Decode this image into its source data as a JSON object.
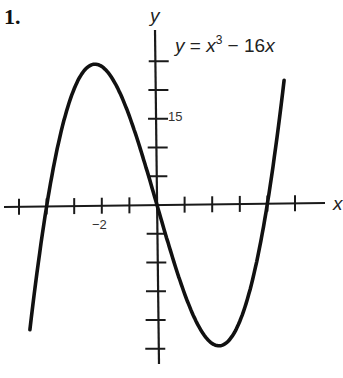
{
  "problem_number": "1.",
  "equation": {
    "lhs": "y",
    "eq": " = ",
    "base": "x",
    "exp": "3",
    "rest": " − 16",
    "var": "x"
  },
  "chart_data": {
    "type": "line",
    "xlabel": "x",
    "ylabel": "y",
    "function": "x^3 - 16x",
    "xlim": [
      -5.5,
      6
    ],
    "ylim": [
      -27,
      30
    ],
    "x_ticks": [
      -5,
      -4,
      -3,
      -2,
      -1,
      1,
      2,
      3,
      4,
      5
    ],
    "x_tick_labels": [
      {
        "value": -2,
        "label": "−2"
      }
    ],
    "y_ticks": [
      -25,
      -20,
      -15,
      -10,
      -5,
      5,
      10,
      15,
      20,
      25
    ],
    "y_tick_labels": [
      {
        "value": 15,
        "label": "15"
      }
    ],
    "grid": false,
    "legend": "none",
    "points": [
      {
        "x": -4.55,
        "y": -21.4
      },
      {
        "x": -4,
        "y": 0
      },
      {
        "x": -3,
        "y": 21
      },
      {
        "x": -2.31,
        "y": 24.6
      },
      {
        "x": -2,
        "y": 24
      },
      {
        "x": -1,
        "y": 15
      },
      {
        "x": 0,
        "y": 0
      },
      {
        "x": 1,
        "y": -15
      },
      {
        "x": 2,
        "y": -24
      },
      {
        "x": 2.31,
        "y": -24.6
      },
      {
        "x": 3,
        "y": -21
      },
      {
        "x": 4,
        "y": 0
      },
      {
        "x": 4.55,
        "y": 21.4
      }
    ],
    "x_range_drawn": [
      -4.55,
      4.55
    ],
    "roots": [
      -4,
      0,
      4
    ],
    "local_max": {
      "x": -2.31,
      "y": 24.6
    },
    "local_min": {
      "x": 2.31,
      "y": -24.6
    }
  }
}
